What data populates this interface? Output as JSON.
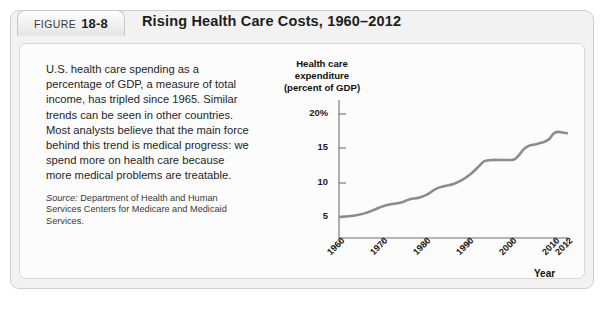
{
  "figure": {
    "tab_word": "FIGURE",
    "tab_number": "18-8",
    "title": "Rising Health Care Costs, 1960–2012"
  },
  "caption": {
    "body": "U.S. health care spending as a percentage of GDP, a measure of total income, has tripled since 1965. Similar trends can be seen in other countries. Most analysts believe that the main force behind this trend is medical progress: we spend more on health care because more medical problems are treatable.",
    "source_lead": "Source:",
    "source_text": " Department of Health and Human Services Centers for Medicare and Medicaid Services."
  },
  "chart_data": {
    "type": "line",
    "title": "Rising Health Care Costs, 1960–2012",
    "axis_title_lines": [
      "Health care",
      "expenditure",
      "(percent of GDP)"
    ],
    "ylabel": "Health care expenditure (percent of GDP)",
    "xlabel": "Year",
    "ylim": [
      0,
      20
    ],
    "xlim": [
      1960,
      2012
    ],
    "yticks": [
      5,
      10,
      15,
      20
    ],
    "ytick_labels": [
      "5",
      "10",
      "15",
      "20%"
    ],
    "xticks": [
      1960,
      1970,
      1980,
      1990,
      2000,
      2010,
      2012
    ],
    "xtick_labels": [
      "1960",
      "1970",
      "1980",
      "1990",
      "2000",
      "2010",
      "2012"
    ],
    "grid": false,
    "legend": null,
    "line_color": "#8c8c8c",
    "series": [
      {
        "name": "U.S. health care expenditure (percent of GDP)",
        "x": [
          1960,
          1962,
          1964,
          1966,
          1968,
          1970,
          1972,
          1974,
          1976,
          1978,
          1980,
          1982,
          1984,
          1986,
          1988,
          1990,
          1992,
          1993,
          1995,
          1997,
          1999,
          2000,
          2001,
          2002,
          2003,
          2004,
          2005,
          2006,
          2007,
          2008,
          2009,
          2010,
          2011,
          2012
        ],
        "values": [
          5.0,
          5.1,
          5.3,
          5.6,
          6.1,
          6.6,
          6.9,
          7.1,
          7.6,
          7.8,
          8.3,
          9.1,
          9.5,
          9.8,
          10.4,
          11.3,
          12.5,
          13.1,
          13.3,
          13.3,
          13.3,
          13.4,
          14.0,
          14.8,
          15.3,
          15.5,
          15.6,
          15.8,
          16.0,
          16.4,
          17.2,
          17.4,
          17.3,
          17.2
        ]
      }
    ]
  }
}
